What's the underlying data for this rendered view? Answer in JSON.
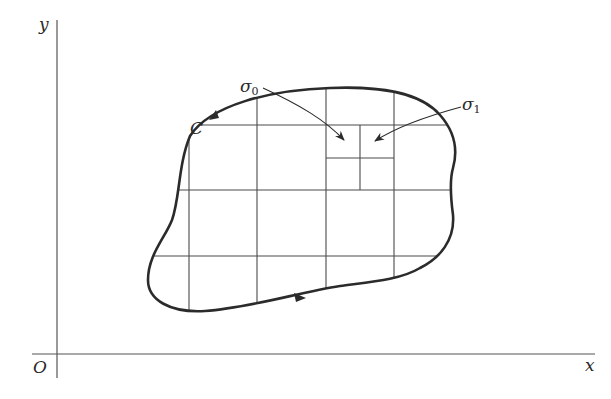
{
  "figure": {
    "axes": {
      "x_label": "x",
      "y_label": "y",
      "origin_label": "O"
    },
    "curve": {
      "label": "C",
      "orientation": "counterclockwise"
    },
    "annotations": {
      "sigma0": {
        "symbol": "σ",
        "subscript": "0"
      },
      "sigma1": {
        "symbol": "σ",
        "subscript": "1"
      }
    },
    "colors": {
      "curve": "#2b2b2b",
      "grid": "#4a4a4a",
      "axes": "#555555",
      "background": "#ffffff"
    }
  }
}
